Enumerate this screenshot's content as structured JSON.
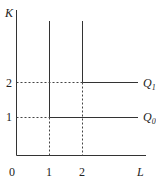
{
  "diagram": {
    "type": "isoquant",
    "y_axis_label": "K",
    "x_axis_label": "L",
    "origin_label": "0",
    "x_ticks": [
      "1",
      "2"
    ],
    "y_ticks": [
      "1",
      "2"
    ],
    "curves": [
      {
        "name": "Q",
        "sub": "0",
        "corner": [
          1,
          1
        ]
      },
      {
        "name": "Q",
        "sub": "1",
        "corner": [
          2,
          2
        ]
      }
    ]
  }
}
